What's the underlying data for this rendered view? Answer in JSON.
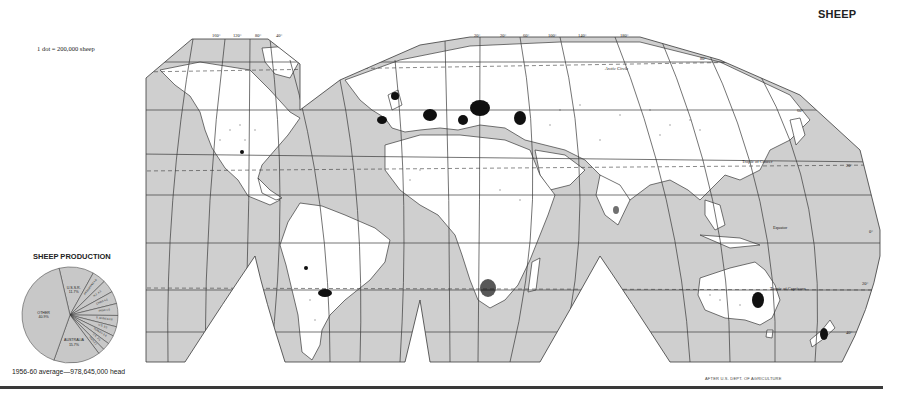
{
  "title": "SHEEP",
  "legend": {
    "dot_scale": "1 dot = 200,000 sheep"
  },
  "credit": "AFTER U.S. DEPT. OF AGRICULTURE",
  "map": {
    "longitude_labels_west": [
      "160°",
      "120°",
      "80°",
      "40°"
    ],
    "longitude_labels_east": [
      "20°",
      "20°",
      "60°",
      "100°",
      "140°",
      "180°"
    ],
    "latitude_labels": [
      "80°",
      "60°",
      "20°",
      "0°",
      "20°",
      "40°"
    ],
    "line_labels": {
      "arctic": "Arctic Circle",
      "cancer": "Tropic of Cancer",
      "equator": "Equator",
      "capricorn": "Tropic of Capricorn"
    },
    "colors": {
      "ocean": "#cfcfcf",
      "land": "#ffffff",
      "outline": "#3a3a3a",
      "dots": "#111111"
    }
  },
  "pie": {
    "title": "SHEEP PRODUCTION",
    "caption": "1956-60 average—978,645,000 head",
    "fill": "#c8c8c8"
  },
  "chart_data": {
    "type": "pie",
    "title": "SHEEP PRODUCTION",
    "subtitle": "1956-60 average—978,645,000 head",
    "categories": [
      "U.S.S.R.",
      "ARGENTINA",
      "N.Z.",
      "CHINA",
      "INDIA",
      "S. AFRICA",
      "U.S.",
      "TURKEY",
      "U.K.",
      "IRAN",
      "AUSTRALIA",
      "OTHER"
    ],
    "values": [
      11.7,
      4.6,
      4.3,
      4.2,
      4.0,
      3.8,
      3.2,
      3.0,
      2.5,
      2.1,
      15.7,
      40.9
    ],
    "units": "percent"
  }
}
